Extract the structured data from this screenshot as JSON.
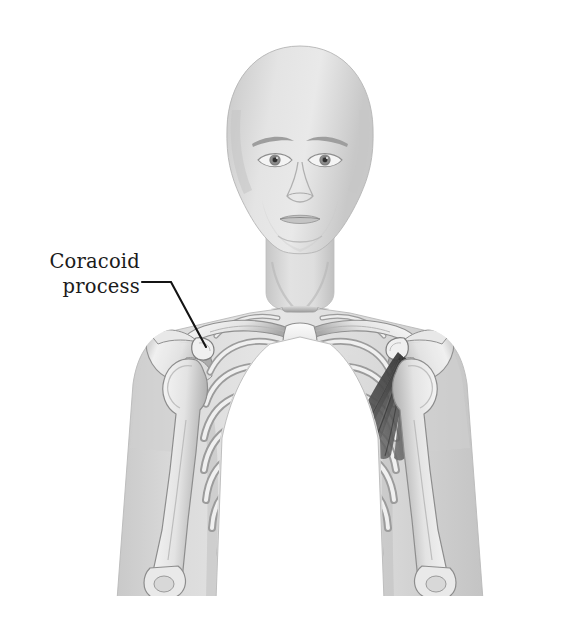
{
  "figure": {
    "background_color": "#ffffff",
    "body_tone": "#d9d9d9",
    "bone_tone": "#eeeeee",
    "bone_outline": "#8d8d8d",
    "muscle_color": "#4a4a4a",
    "leader_color": "#141414",
    "label_color": "#1b1b1b"
  },
  "annotations": [
    {
      "id": "coracoid-process",
      "line_1": "Coracoid",
      "line_2": "process",
      "leader": {
        "horizontal_start_x": 142,
        "horizontal_end_x": 171,
        "horizontal_y": 282,
        "tip_x": 206,
        "tip_y": 347
      }
    }
  ],
  "structures": {
    "head": "bald human head, anterior view",
    "cervical_spine": "cervical vertebrae C1-C7",
    "clavicle_left": "left clavicle",
    "clavicle_right": "right clavicle",
    "scapula_left": "left scapula with coracoid process and acromion",
    "scapula_right": "right scapula with coracoid process and acromion",
    "sternum": "manubrium, sternal body, xiphoid process",
    "ribs": "ribs 1 through 10 bilaterally",
    "humerus_left": "left humerus",
    "humerus_right": "right humerus",
    "lumbar_spine": "lumbar vertebrae L1-L3",
    "muscle": "pectoralis minor, fanning from coracoid process to ribs 3-5"
  }
}
